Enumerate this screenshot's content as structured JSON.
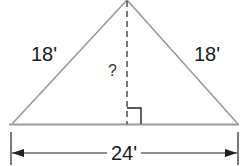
{
  "diagram": {
    "type": "isosceles-triangle",
    "left_side_label": "18'",
    "right_side_label": "18'",
    "height_label": "?",
    "base_label": "24'",
    "colors": {
      "triangle": "#9a9a9a",
      "lines": "#222222",
      "text": "#1a1a1a"
    }
  }
}
